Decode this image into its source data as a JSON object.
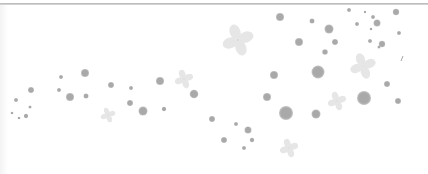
{
  "colors": {
    "background": "#ffffff",
    "rule": "#b4b4b4",
    "dot": "#a9a9a9",
    "dot_light": "#c4c4c4",
    "flower": "#e6e6e6",
    "flower_center": "#cfcfcf"
  },
  "dots": [
    [
      61,
      77,
      2
    ],
    [
      85,
      73,
      4
    ],
    [
      111,
      85,
      3
    ],
    [
      131,
      88,
      2
    ],
    [
      160,
      81,
      4
    ],
    [
      16,
      100,
      2
    ],
    [
      31,
      90,
      3
    ],
    [
      12,
      113,
      1.3
    ],
    [
      19,
      118,
      1.3
    ],
    [
      26,
      116,
      2.2
    ],
    [
      30,
      107,
      1.6
    ],
    [
      59,
      90,
      2
    ],
    [
      70,
      97,
      4
    ],
    [
      86,
      96,
      2.5
    ],
    [
      130,
      103,
      3
    ],
    [
      143,
      111,
      4.5
    ],
    [
      164,
      109,
      2.2
    ],
    [
      194,
      94,
      4.3
    ],
    [
      280,
      17,
      4
    ],
    [
      312,
      21,
      2.5
    ],
    [
      329,
      29,
      4.5
    ],
    [
      349,
      10,
      2
    ],
    [
      365,
      12,
      1.2
    ],
    [
      373,
      17,
      2
    ],
    [
      377,
      23,
      3.5
    ],
    [
      396,
      12,
      3.2
    ],
    [
      357,
      24,
      2
    ],
    [
      371,
      29,
      1.3
    ],
    [
      399,
      33,
      2
    ],
    [
      299,
      42,
      4
    ],
    [
      335,
      42,
      3
    ],
    [
      370,
      41,
      2
    ],
    [
      382,
      44,
      3.2
    ],
    [
      379,
      47,
      1.6
    ],
    [
      325,
      52,
      2.8
    ],
    [
      274,
      75,
      4
    ],
    [
      318,
      72,
      6.5
    ],
    [
      387,
      84,
      3
    ],
    [
      267,
      97,
      4
    ],
    [
      286,
      113,
      7
    ],
    [
      316,
      114,
      4.5
    ],
    [
      364,
      98,
      7
    ],
    [
      398,
      101,
      3
    ],
    [
      212,
      119,
      3
    ],
    [
      236,
      124,
      2
    ],
    [
      248,
      130,
      3.5
    ],
    [
      224,
      140,
      3
    ],
    [
      252,
      140,
      2.2
    ],
    [
      244,
      148,
      2
    ]
  ],
  "flowers": [
    [
      238,
      40,
      17
    ],
    [
      184,
      79,
      10
    ],
    [
      108,
      115,
      8
    ],
    [
      363,
      66,
      14
    ],
    [
      337,
      101,
      10
    ],
    [
      289,
      148,
      10
    ]
  ],
  "marks": [
    [
      401,
      61,
      403,
      56
    ]
  ]
}
